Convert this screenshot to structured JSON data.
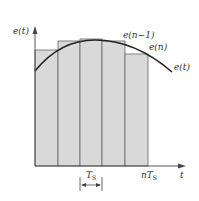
{
  "diagram": {
    "type": "rectangular-integration-approximation",
    "y_axis_label": "e(t)",
    "x_axis_label": "t",
    "curve_label": "e(t)",
    "sample_labels": [
      {
        "text": "e(n−1)"
      },
      {
        "text": "e(n)"
      }
    ],
    "period_label_main": "T",
    "period_label_sub": "S",
    "end_label_prefix": "n",
    "end_label_main": "T",
    "end_label_sub": "S",
    "bars": [
      {
        "index": 1,
        "top": 50
      },
      {
        "index": 2,
        "top": 41
      },
      {
        "index": 3,
        "top": 39
      },
      {
        "index": 4,
        "top": 41
      },
      {
        "index": 5,
        "top": 54
      }
    ],
    "colors": {
      "fill": "#d9d9d9",
      "stroke": "#555555",
      "curve": "#222222"
    }
  }
}
